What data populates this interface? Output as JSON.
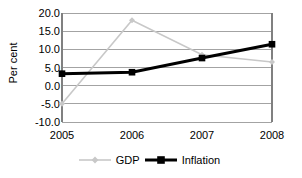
{
  "chart_data": {
    "type": "line",
    "title": "",
    "xlabel": "",
    "ylabel": "Per cent",
    "categories": [
      "2005",
      "2006",
      "2007",
      "2008"
    ],
    "ylim": [
      -10.0,
      20.0
    ],
    "ytick_values": [
      20.0,
      15.0,
      10.0,
      5.0,
      0.0,
      -5.0,
      -10.0
    ],
    "ytick_labels": [
      "20.0",
      "15.0",
      "10.0",
      "5.0",
      "0.0",
      "-5.0",
      "-10.0"
    ],
    "grid": "horizontal",
    "legend_position": "bottom",
    "series": [
      {
        "name": "GDP",
        "values": [
          -5.0,
          18.0,
          8.5,
          6.5
        ],
        "color": "#c8c8c8",
        "marker": "diamond",
        "line_width": 1.6
      },
      {
        "name": "Inflation",
        "values": [
          3.3,
          3.7,
          7.6,
          11.4
        ],
        "color": "#000000",
        "marker": "square",
        "line_width": 3.0
      }
    ]
  },
  "axes": {
    "frame_color": "#808080",
    "grid_color": "#999999"
  },
  "legend": {
    "items": [
      {
        "label": "GDP",
        "color": "#c8c8c8",
        "marker": "diamond"
      },
      {
        "label": "Inflation",
        "color": "#000000",
        "marker": "square"
      }
    ]
  }
}
